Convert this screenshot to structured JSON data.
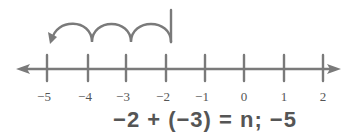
{
  "number_line": {
    "min": -5,
    "max": 2,
    "ticks": [
      "−5",
      "−4",
      "−3",
      "−2",
      "−1",
      "0",
      "1",
      "2"
    ],
    "start": -2,
    "jumps": 3,
    "direction": "left",
    "color": "#777777"
  },
  "equation": {
    "text": "−2 + (−3) = n; −5"
  }
}
